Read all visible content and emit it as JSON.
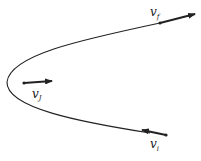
{
  "diagram": {
    "type": "trajectory-with-velocity-vectors",
    "curve": {
      "description": "parabolic orbit opening to the right",
      "color": "#222222"
    },
    "vectors": [
      {
        "id": "vf",
        "symbol": "v",
        "subscript": "f",
        "direction": "right-up, tangent to curve (outgoing)"
      },
      {
        "id": "vJ",
        "symbol": "v",
        "subscript": "J",
        "direction": "right"
      },
      {
        "id": "vi",
        "symbol": "v",
        "subscript": "i",
        "direction": "left-up, tangent to curve (incoming)"
      }
    ]
  },
  "labels": {
    "vf": {
      "main": "v",
      "sub": "f"
    },
    "vJ": {
      "main": "v",
      "sub": "J"
    },
    "vi": {
      "main": "v",
      "sub": "i"
    }
  }
}
